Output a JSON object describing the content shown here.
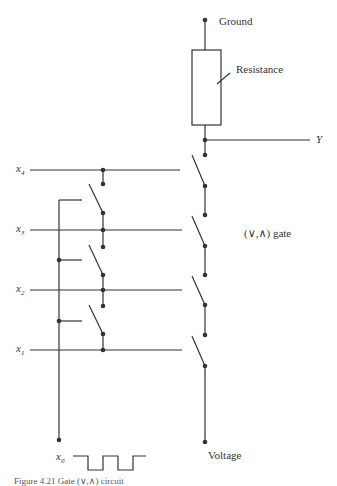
{
  "labels": {
    "ground": "Ground",
    "resistance": "Resistance",
    "output": "Y",
    "gate": "(∨,∧) gate",
    "voltage": "Voltage",
    "x4": "x",
    "x4_sub": "4",
    "x3": "x",
    "x3_sub": "3",
    "x2": "x",
    "x2_sub": "2",
    "x1": "x",
    "x1_sub": "1",
    "x0": "x",
    "x0_sub": "0"
  },
  "caption": "Figure 4.21  Gate (∨,∧) circuit",
  "colors": {
    "line": "#333333",
    "background": "#ffffff"
  }
}
